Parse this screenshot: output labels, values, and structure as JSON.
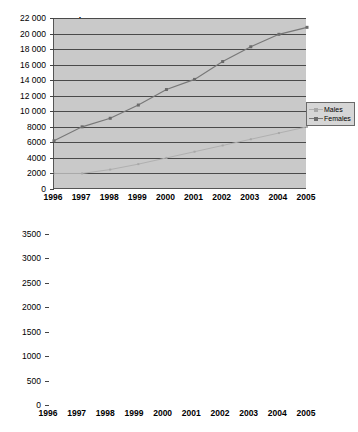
{
  "document": {
    "kind": "two-line-charts"
  },
  "colors": {
    "plot_background": "#c9c9c9",
    "gridline": "#4a4a4a",
    "axis": "#555555",
    "males_series": "#b0b0b0",
    "females_series": "#787878",
    "legend_background": "#d6d6d6",
    "legend_border": "#6a6a6a",
    "text": "#000000"
  },
  "charts": [
    {
      "id": "chart-top",
      "title": "Numbers",
      "legend": {
        "position": "right",
        "entries": [
          {
            "label": "Males",
            "color": "#b0b0b0",
            "marker": "small-dot"
          },
          {
            "label": "Females",
            "color": "#787878",
            "marker": "square"
          }
        ]
      },
      "yticks": [
        "0",
        "2000",
        "4000",
        "6000",
        "8000",
        "10 000",
        "12 000",
        "14 000",
        "16 000",
        "18 000",
        "20 000",
        "22 000"
      ],
      "xticks": [
        "1996",
        "1997",
        "1998",
        "1999",
        "2000",
        "2001",
        "2002",
        "2003",
        "2004",
        "2005"
      ]
    },
    {
      "id": "chart-bottom",
      "title": "Numbers",
      "legend": {
        "position": "right",
        "entries": [
          {
            "label": "Males",
            "color": "#b0b0b0",
            "marker": "small-dot"
          },
          {
            "label": "Females",
            "color": "#787878",
            "marker": "square"
          }
        ]
      },
      "yticks": [
        "0",
        "500",
        "1000",
        "1500",
        "2000",
        "2500",
        "3000",
        "3500"
      ],
      "xticks": [
        "1996",
        "1997",
        "1998",
        "1999",
        "2000",
        "2001",
        "2002",
        "2003",
        "2004",
        "2005"
      ]
    }
  ],
  "chart_data": [
    {
      "type": "line",
      "title": "Numbers",
      "xlabel": "",
      "ylabel": "Numbers",
      "categories": [
        "1996",
        "1997",
        "1998",
        "1999",
        "2000",
        "2001",
        "2002",
        "2003",
        "2004",
        "2005"
      ],
      "x": [
        1996,
        1997,
        1998,
        1999,
        2000,
        2001,
        2002,
        2003,
        2004,
        2005
      ],
      "ylim": [
        0,
        22000
      ],
      "ytick_step": 2000,
      "grid": true,
      "legend_position": "right",
      "series": [
        {
          "name": "Males",
          "color": "#b0b0b0",
          "values": [
            2000,
            2000,
            2500,
            3200,
            4000,
            4800,
            5600,
            6400,
            7200,
            8000
          ]
        },
        {
          "name": "Females",
          "color": "#787878",
          "values": [
            6200,
            8000,
            9100,
            10800,
            12800,
            14100,
            16400,
            18300,
            19900,
            20800
          ]
        }
      ]
    },
    {
      "type": "line",
      "title": "Numbers",
      "xlabel": "",
      "ylabel": "Numbers",
      "categories": [
        "1996",
        "1997",
        "1998",
        "1999",
        "2000",
        "2001",
        "2002",
        "2003",
        "2004",
        "2005"
      ],
      "x": [
        1996,
        1997,
        1998,
        1999,
        2000,
        2001,
        2002,
        2003,
        2004,
        2005
      ],
      "ylim": [
        0,
        3500
      ],
      "ytick_step": 500,
      "grid": true,
      "legend_position": "right",
      "series": [
        {
          "name": "Males",
          "color": "#b0b0b0",
          "values": [
            1430,
            1450,
            1440,
            1430,
            1960,
            2030,
            2250,
            2070,
            1970,
            1620
          ]
        },
        {
          "name": "Females",
          "color": "#787878",
          "values": [
            950,
            1000,
            1030,
            1890,
            2410,
            2640,
            2800,
            2840,
            2500,
            2050
          ]
        }
      ]
    }
  ]
}
